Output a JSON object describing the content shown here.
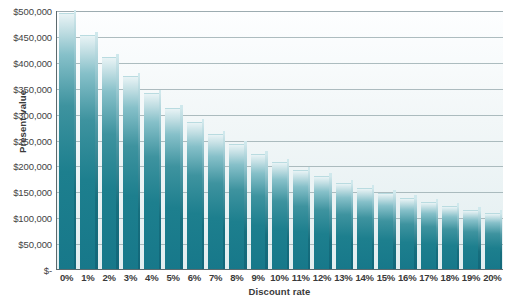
{
  "chart_data": {
    "type": "bar",
    "title": "",
    "xlabel": "Discount rate",
    "ylabel": "Present value",
    "categories": [
      "0%",
      "1%",
      "2%",
      "3%",
      "4%",
      "5%",
      "6%",
      "7%",
      "8%",
      "9%",
      "10%",
      "11%",
      "12%",
      "13%",
      "14%",
      "15%",
      "16%",
      "17%",
      "18%",
      "19%",
      "20%"
    ],
    "values": [
      492000,
      450000,
      408000,
      371000,
      337000,
      308000,
      282000,
      259000,
      239000,
      221000,
      205000,
      190000,
      177000,
      165000,
      154000,
      144000,
      135000,
      127000,
      119000,
      112000,
      106000
    ],
    "ylim": [
      0,
      500000
    ],
    "ytick_values": [
      0,
      50000,
      100000,
      150000,
      200000,
      250000,
      300000,
      350000,
      400000,
      450000,
      500000
    ],
    "ytick_labels": [
      "$-",
      "$50,000",
      "$100,000",
      "$150,000",
      "$200,000",
      "$250,000",
      "$300,000",
      "$350,000",
      "$400,000",
      "$450,000",
      "$500,000"
    ],
    "grid": true,
    "legend": false,
    "legend_position": "none",
    "series_color": "#1d7f8e"
  },
  "colors": {
    "bar_fill": "#1d7f8e",
    "bar_highlight": "#bfdde2",
    "bar_side": "#176f7e",
    "plot_background": "#eef6f7",
    "gridline": "#9fb0b4",
    "axis_line": "#5b6a6e",
    "text": "#3a3a3a"
  }
}
